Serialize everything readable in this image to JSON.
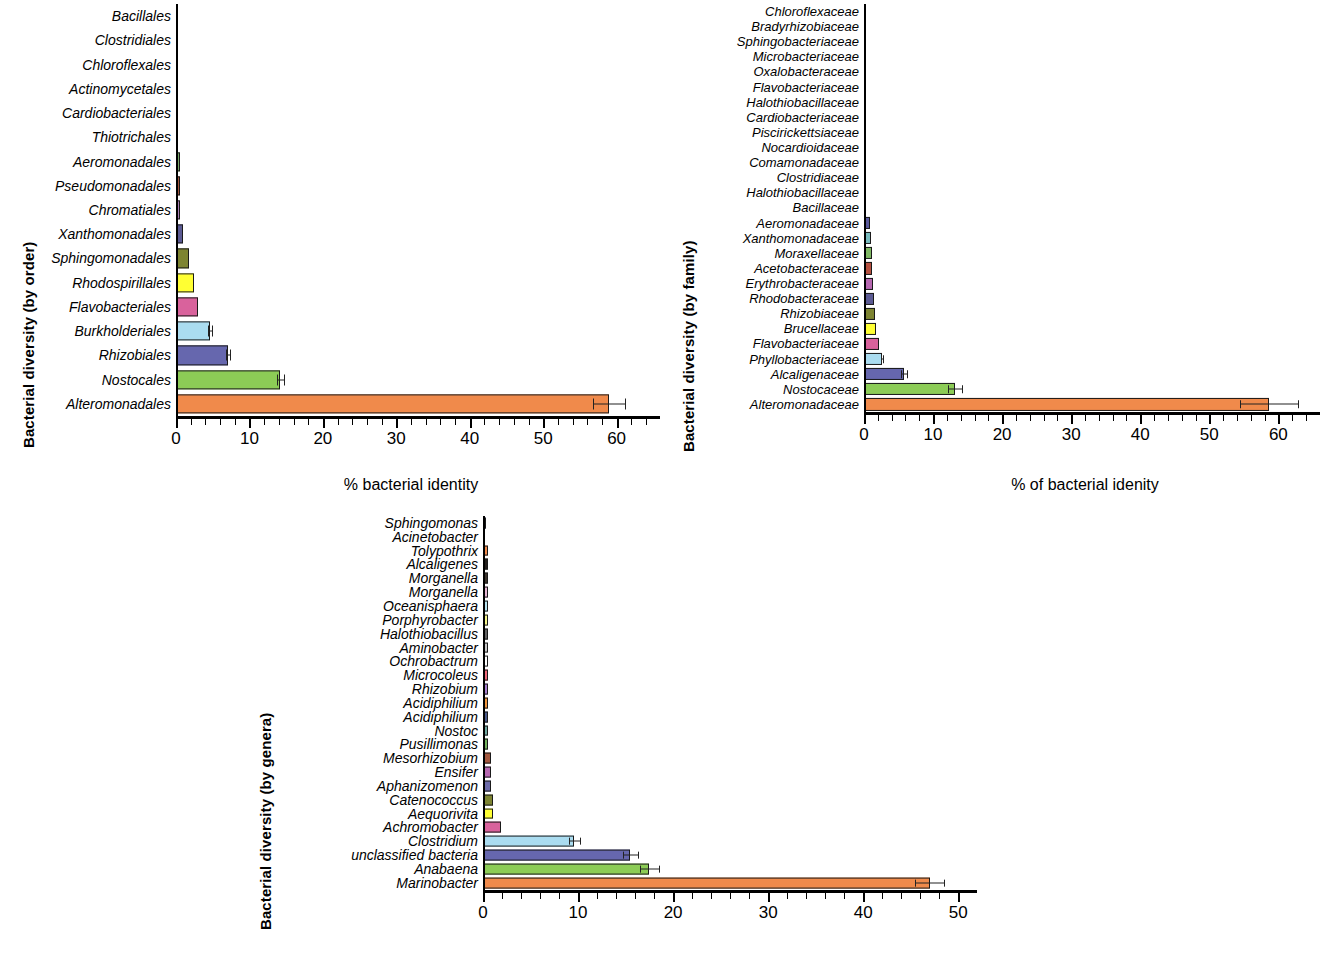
{
  "figure": {
    "panel_count": 3,
    "background": "#ffffff"
  },
  "chart_data": [
    {
      "id": "panel-order",
      "type": "bar",
      "orientation": "horizontal",
      "title": "",
      "ylabel": "Bacterial diversity (by order)",
      "xlabel": "% bacterial identity",
      "xlim": [
        0,
        64
      ],
      "xticks": [
        0,
        10,
        20,
        30,
        40,
        50,
        60
      ],
      "xticklabels": [
        "0",
        "10",
        "20",
        "30",
        "40",
        "50",
        "60"
      ],
      "grid": false,
      "legend": "none",
      "categories": [
        "Bacillales",
        "Clostridiales",
        "Chloroflexales",
        "Actinomycetales",
        "Cardiobacteriales",
        "Thiotrichales",
        "Aeromonadales",
        "Pseudomonadales",
        "Chromatiales",
        "Xanthomonadales",
        "Sphingomonadales",
        "Rhodospirillales",
        "Flavobacteriales",
        "Burkholderiales",
        "Rhizobiales",
        "Nostocales",
        "Alteromonadales"
      ],
      "values": [
        0.15,
        0.2,
        0.2,
        0.25,
        0.3,
        0.3,
        0.5,
        0.5,
        0.6,
        0.9,
        1.8,
        2.5,
        3.0,
        4.6,
        7.1,
        14.2,
        59.0
      ],
      "errors": [
        0,
        0,
        0,
        0,
        0,
        0,
        0,
        0,
        0,
        0,
        0,
        0,
        0,
        0.25,
        0.3,
        0.45,
        2.2
      ],
      "colors": [
        "#ffffff",
        "#d48a97",
        "#8f7fa8",
        "#c0a057",
        "#4a4036",
        "#8a8a8a",
        "#7aa96a",
        "#a4583f",
        "#a97fb5",
        "#5b5a93",
        "#7d8431",
        "#ffff33",
        "#d9629c",
        "#aadcf0",
        "#6667ae",
        "#8ccc56",
        "#f08a4b"
      ]
    },
    {
      "id": "panel-family",
      "type": "bar",
      "orientation": "horizontal",
      "title": "",
      "ylabel": "Bacterial diversity (by family)",
      "xlabel": "% of bacterial idenity",
      "xlim": [
        0,
        64
      ],
      "xticks": [
        0,
        10,
        20,
        30,
        40,
        50,
        60
      ],
      "xticklabels": [
        "0",
        "10",
        "20",
        "30",
        "40",
        "50",
        "60"
      ],
      "grid": false,
      "legend": "none",
      "categories": [
        "Chloroflexaceae",
        "Bradyrhizobiaceae",
        "Sphingobacteriaceae",
        "Microbacteriaceae",
        "Oxalobacteraceae",
        "Flavobacteriaceae",
        "Halothiobacillaceae",
        "Cardiobacteriaceae",
        "Piscirickettsiaceae",
        "Nocardioidaceae",
        "Comamonadaceae",
        "Clostridiaceae",
        "Halothiobacillaceae",
        "Bacillaceae",
        "Aeromonadaceae",
        "Xanthomonadaceae",
        "Moraxellaceae",
        "Acetobacteraceae",
        "Erythrobacteraceae",
        "Rhodobacteraceae",
        "Rhizobiaceae",
        "Brucellaceae",
        "Flavobacteriaceae",
        "Phyllobacteriaceae",
        "Alcaligenaceae",
        "Nostocaceae",
        "Alteromonadaceae"
      ],
      "values": [
        0.12,
        0.12,
        0.15,
        0.15,
        0.15,
        0.18,
        0.18,
        0.2,
        0.2,
        0.2,
        0.22,
        0.25,
        0.25,
        0.3,
        0.9,
        1.0,
        1.1,
        1.2,
        1.3,
        1.5,
        1.6,
        1.7,
        2.1,
        2.6,
        5.8,
        13.2,
        58.6
      ],
      "errors": [
        0,
        0,
        0,
        0,
        0,
        0,
        0,
        0,
        0,
        0,
        0,
        0,
        0,
        0,
        0,
        0,
        0,
        0,
        0,
        0,
        0,
        0,
        0,
        0.2,
        0.45,
        1.0,
        4.2
      ],
      "colors": [
        "#6c6aa8",
        "#86b36a",
        "#b98a63",
        "#3b342c",
        "#4a4036",
        "#b5a0b8",
        "#9aa6ab",
        "#a5a06a",
        "#585868",
        "#a6a6a6",
        "#96b39a",
        "#c08a96",
        "#7b6fa0",
        "#d8a868",
        "#5b5a9c",
        "#79bcbf",
        "#7fb863",
        "#b5503f",
        "#b667b0",
        "#5b5a93",
        "#7d8431",
        "#ffff33",
        "#d9629c",
        "#aadcf0",
        "#6667ae",
        "#8ccc56",
        "#f08a4b"
      ]
    },
    {
      "id": "panel-genera",
      "type": "bar",
      "orientation": "horizontal",
      "title": "",
      "ylabel": "Bacterial diversity (by genera)",
      "xlabel": "% of bacterial identity",
      "xlim": [
        0,
        50.5
      ],
      "xticks": [
        0,
        10,
        20,
        30,
        40,
        50
      ],
      "xticklabels": [
        "0",
        "10",
        "20",
        "30",
        "40",
        "50"
      ],
      "grid": false,
      "legend": "none",
      "categories": [
        "Sphingomonas",
        "Acinetobacter",
        "Tolypothrix",
        "Alcaligenes",
        "Morganella",
        "Morganella",
        "Oceanisphaera",
        "Porphyrobacter",
        "Halothiobacillus",
        "Aminobacter",
        "Ochrobactrum",
        "Microcoleus",
        "Rhizobium",
        "Acidiphilium",
        "Acidiphilium",
        "Nostoc",
        "Pusillimonas",
        "Mesorhizobium",
        "Ensifer",
        "Aphanizomenon",
        "Catenococcus",
        "Aequorivita",
        "Achromobacter",
        "Clostridium",
        "unclassified bacteria",
        "Anabaena",
        "Marinobacter"
      ],
      "values": [
        0.35,
        0.25,
        0.5,
        0.5,
        0.5,
        0.5,
        0.5,
        0.5,
        0.5,
        0.5,
        0.5,
        0.5,
        0.5,
        0.5,
        0.5,
        0.55,
        0.55,
        0.8,
        0.8,
        0.85,
        1.1,
        1.1,
        1.9,
        9.6,
        15.5,
        17.5,
        47.0
      ],
      "errors": [
        0,
        0,
        0,
        0,
        0,
        0,
        0,
        0,
        0,
        0,
        0,
        0,
        0,
        0,
        0,
        0,
        0,
        0,
        0,
        0,
        0,
        0,
        0,
        0.6,
        0.8,
        1.0,
        1.5
      ],
      "colors": [
        "#5b5a9c",
        "#7fae72",
        "#f08a4b",
        "#241f1c",
        "#3b342c",
        "#e7b6d4",
        "#b8e4f0",
        "#f5f58a",
        "#636363",
        "#c8c8c8",
        "#ffffff",
        "#f06a7a",
        "#a87fd0",
        "#f2963c",
        "#4a5a8a",
        "#6fa8a0",
        "#74b35e",
        "#a4583f",
        "#b667b0",
        "#6c6aa8",
        "#7d8431",
        "#ffff33",
        "#d9629c",
        "#aadcf0",
        "#6667ae",
        "#8ccc56",
        "#f08a4b"
      ]
    }
  ]
}
